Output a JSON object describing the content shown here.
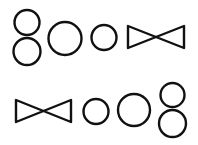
{
  "colors": {
    "background": "#ffffff",
    "stroke": "#111111"
  },
  "rows": [
    {
      "name": "top-row",
      "shapes": [
        "figure-eight",
        "large-circle",
        "small-circle",
        "bowtie"
      ]
    },
    {
      "name": "bottom-row",
      "shapes": [
        "bowtie",
        "small-circle",
        "large-circle",
        "figure-eight"
      ]
    }
  ]
}
